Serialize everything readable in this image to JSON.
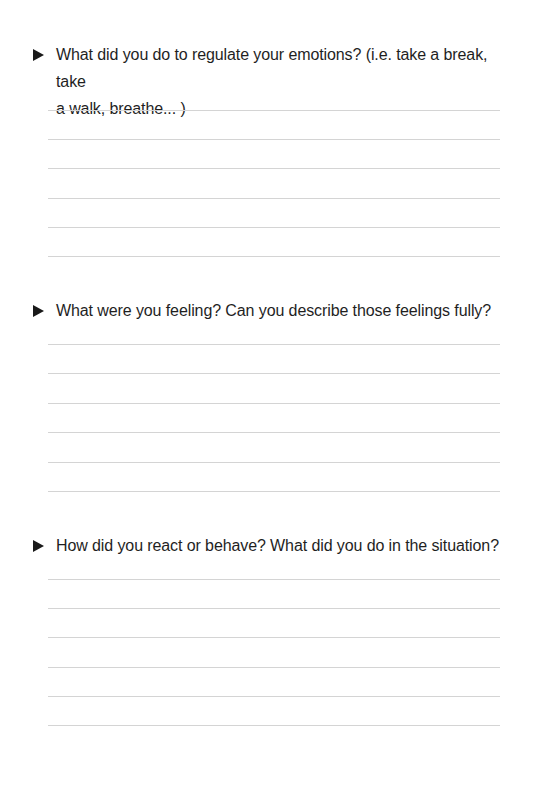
{
  "worksheet": {
    "questions": [
      {
        "text": "What did you do to regulate your emotions? (i.e. take a break, take a walk, breathe... )",
        "line1": "What did you do to regulate your emotions? (i.e. take a break, take",
        "line2": "a walk, breathe... )",
        "answer_lines": 6
      },
      {
        "text": "What were you feeling? Can you describe those feelings fully?",
        "answer_lines": 6
      },
      {
        "text": "How did you react or behave? What did you do in the situation?",
        "answer_lines": 6
      }
    ],
    "bullet_icon": "right-pointing-triangle",
    "colors": {
      "text": "#1f1f1f",
      "rule": "#d4d4d4",
      "background": "#ffffff"
    }
  }
}
